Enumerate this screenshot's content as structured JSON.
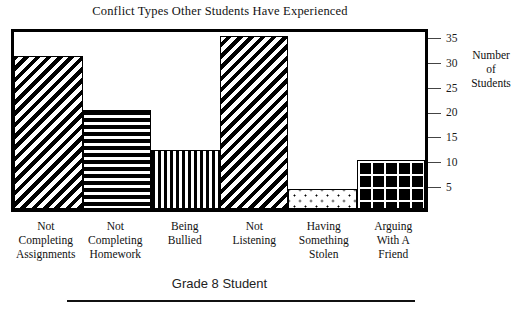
{
  "chart_data": {
    "type": "bar",
    "title": "Conflict Types Other Students Have Experienced",
    "xlabel": "Grade 8 Student",
    "ylabel": "Number of Students",
    "ylabel_lines": [
      "Number",
      "of",
      "Students"
    ],
    "categories": [
      "Not Completing Assignments",
      "Not Completing Homework",
      "Being Bullied",
      "Not Listening",
      "Having Something Stolen",
      "Arguing With A Friend"
    ],
    "category_lines": [
      [
        "Not",
        "Completing",
        "Assignments"
      ],
      [
        "Not",
        "Completing",
        "Homework"
      ],
      [
        "Being",
        "Bullied"
      ],
      [
        "Not",
        "Listening"
      ],
      [
        "Having",
        "Something",
        "Stolen"
      ],
      [
        "Arguing",
        "With A",
        "Friend"
      ]
    ],
    "values": [
      31,
      20,
      12,
      35,
      4,
      10
    ],
    "bar_patterns": [
      "diagonal-stripes",
      "horizontal-stripes",
      "vertical-stripes",
      "diagonal-stripes",
      "dotted",
      "grid"
    ],
    "ylim": [
      0,
      37
    ],
    "yticks": [
      5,
      10,
      15,
      20,
      25,
      30,
      35
    ],
    "ytick_labels": [
      "5",
      "10",
      "15",
      "20",
      "25",
      "30",
      "35"
    ],
    "y_axis_position": "right",
    "grid": false,
    "legend": "none",
    "colors": {
      "ink": "#000000",
      "background": "#ffffff",
      "tick": "#444444"
    }
  }
}
